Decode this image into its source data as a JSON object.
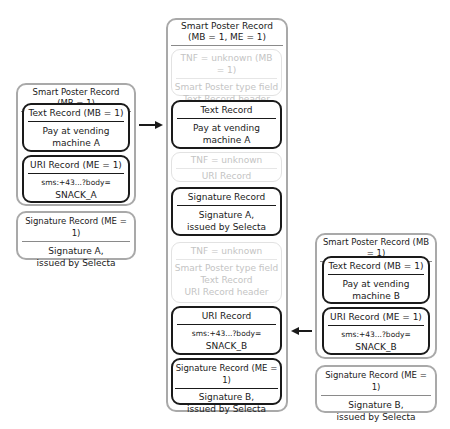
{
  "left": {
    "smart_poster": {
      "title": "Smart Poster Record (MB = 1)",
      "text_record": {
        "header": "Text Record (MB = 1)",
        "body_line1": "Pay at vending",
        "body_line2": "machine A"
      },
      "uri_record": {
        "header": "URI Record (ME = 1)",
        "body_line1": "sms:+43...?body=",
        "body_line2": "SNACK_A"
      }
    },
    "signature": {
      "header": "Signature Record (ME = 1)",
      "body_line1": "Signature A,",
      "body_line2": "issued by Selecta"
    }
  },
  "center": {
    "title_line1": "Smart Poster Record",
    "title_line2": "(MB = 1, ME = 1)",
    "ghost1": {
      "header": "TNF = unknown (MB = 1)",
      "body_line1": "Smart Poster type field",
      "body_line2": "Text Record header"
    },
    "text_record": {
      "header": "Text Record",
      "body_line1": "Pay at vending",
      "body_line2": "machine A"
    },
    "ghost2": {
      "header": "TNF = unknown",
      "body_line1": "URI Record"
    },
    "signature_a": {
      "header": "Signature Record",
      "body_line1": "Signature A,",
      "body_line2": "issued by Selecta"
    },
    "ghost3": {
      "header": "TNF = unknown",
      "body_line1": "Smart Poster type field",
      "body_line2": "Text Record",
      "body_line3": "URI Record header"
    },
    "uri_record": {
      "header": "URI Record",
      "body_line1": "sms:+43...?body=",
      "body_line2": "SNACK_B"
    },
    "signature_b": {
      "header": "Signature Record (ME = 1)",
      "body_line1": "Signature B,",
      "body_line2": "issued by Selecta"
    }
  },
  "right": {
    "smart_poster": {
      "title": "Smart Poster Record (MB = 1)",
      "text_record": {
        "header": "Text Record (MB = 1)",
        "body_line1": "Pay at vending",
        "body_line2": "machine B"
      },
      "uri_record": {
        "header": "URI Record (ME = 1)",
        "body_line1": "sms:+43...?body=",
        "body_line2": "SNACK_B"
      }
    },
    "signature": {
      "header": "Signature Record (ME = 1)",
      "body_line1": "Signature B,",
      "body_line2": "issued by Selecta"
    }
  },
  "arrows": {
    "left_to_center": "right-arrow",
    "right_to_center": "left-arrow"
  },
  "colors": {
    "outer_border": "#a9a9a9",
    "record_border": "#1a1a1a",
    "ghost_text": "#c4c4c4"
  }
}
